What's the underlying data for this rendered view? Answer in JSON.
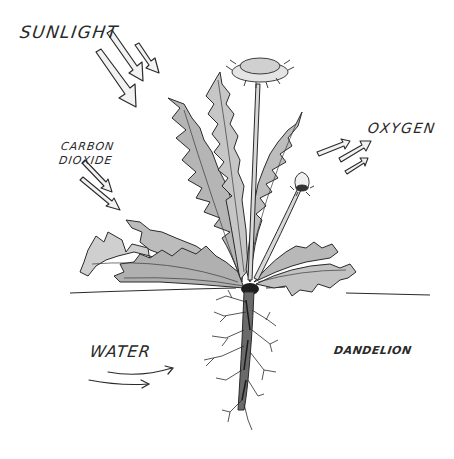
{
  "labels": {
    "sunlight": "SUNLIGHT",
    "carbon_dioxide_line1": "CARBON",
    "carbon_dioxide_line2": "DIOXIDE",
    "oxygen": "OXYGEN",
    "water": "WATER",
    "dandelion": "DANDELION"
  },
  "arrows": {
    "sunlight": {
      "count": 3,
      "direction": "down-right",
      "style": "hollow"
    },
    "carbon_dioxide": {
      "count": 2,
      "direction": "down-right",
      "style": "hollow"
    },
    "oxygen": {
      "count": 3,
      "direction": "up-right",
      "style": "hollow"
    },
    "water": {
      "count": 2,
      "direction": "right",
      "style": "line"
    }
  },
  "colors": {
    "ink": "#2a2a2a",
    "leaf_fill": "#b8b8b8",
    "leaf_light": "#d6d6d6",
    "root": "#555555",
    "background": "#ffffff"
  }
}
